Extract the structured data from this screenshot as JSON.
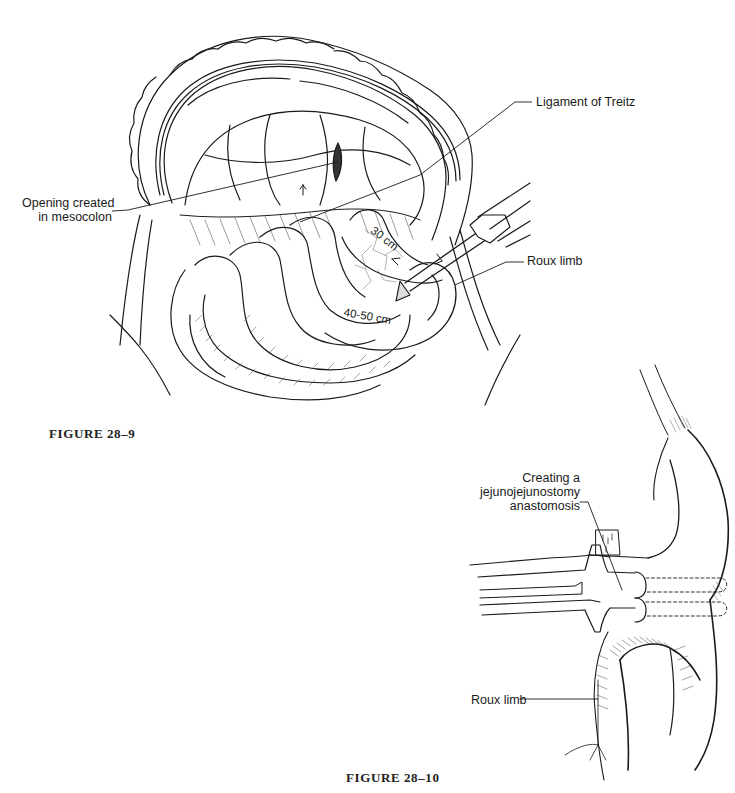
{
  "page": {
    "type": "textbook page (scanned)",
    "top_text_cutoff": "",
    "background": "#ffffff",
    "ink_color": "#1a1a1a"
  },
  "figures": [
    {
      "id": "fig-28-9",
      "caption": "FIGURE 28–9",
      "labels": {
        "opening_line1": "Opening created",
        "opening_line2": "in mesocolon",
        "treitz": "Ligament of Treitz",
        "roux_limb": "Roux limb"
      },
      "annotations": {
        "distance_1": "30 cm",
        "distance_2": "40-50 cm"
      }
    },
    {
      "id": "fig-28-10",
      "caption": "FIGURE 28–10",
      "labels": {
        "creating_line1": "Creating a",
        "creating_line2": "jejunojejunostomy",
        "creating_line3": "anastomosis",
        "roux_limb": "Roux limb"
      }
    }
  ]
}
